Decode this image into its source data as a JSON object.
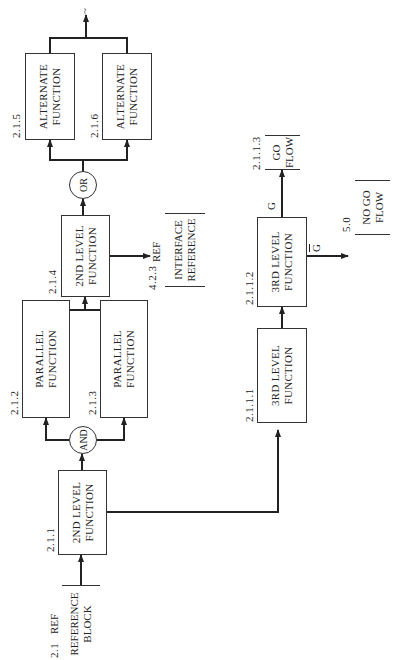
{
  "diagram": {
    "orientation": "rotated 90deg counter-clockwise",
    "reference_block": {
      "number": "2.1",
      "ref": "REF",
      "line1": "REFERENCE",
      "line2": "BLOCK"
    },
    "blocks": [
      {
        "id": "2.1.1",
        "line1": "2ND LEVEL",
        "line2": "FUNCTION"
      },
      {
        "id": "2.1.2",
        "line1": "PARALLEL",
        "line2": "FUNCTION"
      },
      {
        "id": "2.1.3",
        "line1": "PARALLEL",
        "line2": "FUNCTION"
      },
      {
        "id": "2.1.4",
        "line1": "2ND LEVEL",
        "line2": "FUNCTION"
      },
      {
        "id": "2.1.5",
        "line1": "ALTERNATE",
        "line2": "FUNCTION"
      },
      {
        "id": "2.1.6",
        "line1": "ALTERNATE",
        "line2": "FUNCTION"
      },
      {
        "id": "2.1.1.1",
        "line1": "3RD LEVEL",
        "line2": "FUNCTION"
      },
      {
        "id": "2.1.1.2",
        "line1": "3RD LEVEL",
        "line2": "FUNCTION"
      }
    ],
    "gates": {
      "and": "AND",
      "or": "OR"
    },
    "interface_reference": {
      "number": "4.2.3",
      "ref": "REF",
      "line1": "INTERFACE",
      "line2": "REFERENCE"
    },
    "go_flow": {
      "number": "2.1.1.3",
      "line1": "GO",
      "line2": "FLOW",
      "label": "G"
    },
    "no_go_flow": {
      "number": "5.0",
      "line1": "NO GO",
      "line2": "FLOW",
      "label": "G"
    },
    "output_symbol": "~"
  }
}
